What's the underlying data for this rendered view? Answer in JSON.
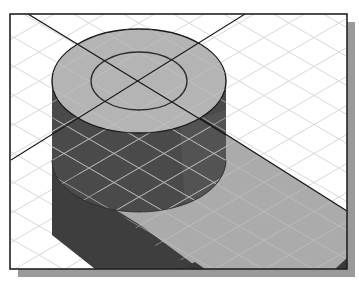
{
  "figure": {
    "colors": {
      "background": "#ffffff",
      "frame_shadow": "#9a9a9a",
      "frame_border": "#222222",
      "grid_line": "#cfcfcf",
      "cylinder_top": "#b4b4b4",
      "cylinder_side": "#4a4a4a",
      "slab_top": "#ababab",
      "slab_side": "#3e3e3e",
      "edge_line": "#1a1a1a"
    },
    "frame": {
      "x": 10,
      "y": 14,
      "width": 337,
      "height": 255,
      "shadow_offset": 8
    },
    "cylinder": {
      "top_center": [
        139,
        81
      ],
      "outer_rx": 87,
      "outer_ry": 52,
      "inner_rx": 48,
      "inner_ry": 29,
      "bottom_y": 212
    },
    "centerlines": [
      {
        "from": [
          28,
          14
        ],
        "to": [
          347,
          211
        ]
      },
      {
        "from": [
          245,
          14
        ],
        "to": [
          11,
          160
        ]
      }
    ]
  }
}
